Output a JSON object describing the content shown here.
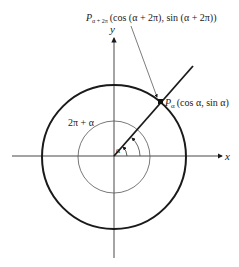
{
  "figure": {
    "x_axis_label": "x",
    "y_axis_label": "y",
    "angle_label": "α",
    "outer_angle_label": "2π + α",
    "point_main": {
      "name": "P",
      "subscript": "α",
      "coords": "(cos α, sin α)"
    },
    "point_top": {
      "name": "P",
      "subscript": "α + 2π",
      "coords": "(cos (α + 2π), sin (α + 2π))"
    }
  }
}
